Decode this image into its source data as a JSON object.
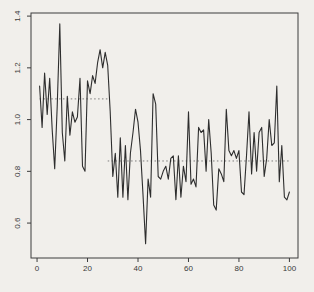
{
  "chart_data": {
    "type": "line",
    "title": "",
    "xlabel": "",
    "ylabel": "",
    "x_ticks": [
      0,
      20,
      40,
      60,
      80,
      100
    ],
    "x_tick_labels": [
      "0",
      "20",
      "40",
      "60",
      "80",
      "100"
    ],
    "y_ticks": [
      0.6,
      0.8,
      1.0,
      1.2,
      1.4
    ],
    "y_tick_labels": [
      "0.6",
      "0.8",
      "1.0",
      "1.2",
      "1.4"
    ],
    "xlim": [
      -2.4,
      103.4
    ],
    "ylim": [
      0.465,
      1.412
    ],
    "grid": "off",
    "legend": "none",
    "x_start": 1,
    "x_step": 1,
    "values": [
      1.13,
      0.97,
      1.18,
      1.02,
      1.16,
      0.96,
      0.81,
      1.05,
      1.37,
      0.95,
      0.84,
      1.09,
      0.94,
      1.03,
      0.99,
      1.01,
      1.16,
      0.82,
      0.8,
      1.15,
      1.1,
      1.17,
      1.14,
      1.22,
      1.27,
      1.2,
      1.26,
      1.21,
      1.03,
      0.78,
      0.87,
      0.7,
      0.93,
      0.7,
      0.9,
      0.69,
      0.87,
      0.95,
      1.04,
      0.99,
      0.88,
      0.71,
      0.52,
      0.77,
      0.7,
      1.1,
      1.06,
      0.78,
      0.77,
      0.8,
      0.82,
      0.77,
      0.85,
      0.86,
      0.69,
      0.86,
      0.7,
      0.82,
      0.76,
      1.03,
      0.75,
      0.77,
      0.74,
      0.97,
      0.95,
      0.96,
      0.8,
      1.0,
      0.87,
      0.67,
      0.65,
      0.81,
      0.79,
      0.76,
      1.04,
      0.88,
      0.86,
      0.88,
      0.85,
      0.88,
      0.72,
      0.71,
      0.86,
      1.03,
      0.79,
      0.95,
      0.8,
      0.95,
      0.97,
      0.78,
      0.85,
      1.0,
      0.9,
      0.91,
      1.13,
      0.76,
      0.9,
      0.7,
      0.69,
      0.72
    ],
    "mean_segments": [
      {
        "x_start": 1,
        "x_end": 28,
        "mean": 1.08
      },
      {
        "x_start": 28,
        "x_end": 100,
        "mean": 0.84
      }
    ],
    "colors": {
      "background": "#f1efeb",
      "series_line": "#2e2e2e",
      "axis": "#3c3c3c",
      "tick_label": "#3a3a3a",
      "mean_line": "#7d7d7d"
    }
  }
}
